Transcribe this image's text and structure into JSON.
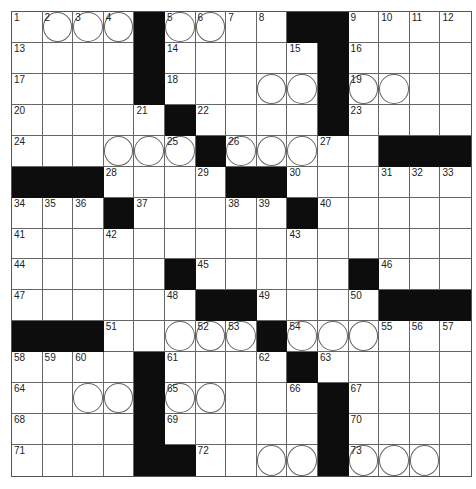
{
  "puzzle": {
    "rows": 15,
    "cols": 15,
    "colors": {
      "black_square": "#0d0d0d",
      "grid_line": "#666666",
      "background": "#ffffff"
    },
    "grid": [
      "....#....##....",
      "....#.....#....",
      "....#.....#....",
      ".....#....#....",
      "......#.....###",
      "###....##......",
      "...#.....#.....",
      "...............",
      ".....#.....#...",
      "......##....###",
      "###.....#......",
      "....#....#.....",
      "....#.....#....",
      "....#.....#....",
      "....##....#...."
    ],
    "circles": [
      [
        0,
        1
      ],
      [
        0,
        2
      ],
      [
        0,
        3
      ],
      [
        0,
        5
      ],
      [
        0,
        6
      ],
      [
        2,
        8
      ],
      [
        2,
        9
      ],
      [
        2,
        11
      ],
      [
        2,
        12
      ],
      [
        4,
        3
      ],
      [
        4,
        4
      ],
      [
        4,
        5
      ],
      [
        4,
        7
      ],
      [
        4,
        8
      ],
      [
        4,
        9
      ],
      [
        10,
        5
      ],
      [
        10,
        6
      ],
      [
        10,
        7
      ],
      [
        10,
        9
      ],
      [
        10,
        10
      ],
      [
        10,
        11
      ],
      [
        12,
        2
      ],
      [
        12,
        3
      ],
      [
        12,
        5
      ],
      [
        12,
        6
      ],
      [
        14,
        8
      ],
      [
        14,
        9
      ],
      [
        14,
        11
      ],
      [
        14,
        12
      ],
      [
        14,
        13
      ]
    ],
    "numbers": [
      {
        "r": 0,
        "c": 0,
        "n": "1"
      },
      {
        "r": 0,
        "c": 1,
        "n": "2"
      },
      {
        "r": 0,
        "c": 2,
        "n": "3"
      },
      {
        "r": 0,
        "c": 3,
        "n": "4"
      },
      {
        "r": 0,
        "c": 5,
        "n": "5"
      },
      {
        "r": 0,
        "c": 6,
        "n": "6"
      },
      {
        "r": 0,
        "c": 7,
        "n": "7"
      },
      {
        "r": 0,
        "c": 8,
        "n": "8"
      },
      {
        "r": 0,
        "c": 11,
        "n": "9"
      },
      {
        "r": 0,
        "c": 12,
        "n": "10"
      },
      {
        "r": 0,
        "c": 13,
        "n": "11"
      },
      {
        "r": 0,
        "c": 14,
        "n": "12"
      },
      {
        "r": 1,
        "c": 0,
        "n": "13"
      },
      {
        "r": 1,
        "c": 5,
        "n": "14"
      },
      {
        "r": 1,
        "c": 9,
        "n": "15"
      },
      {
        "r": 1,
        "c": 11,
        "n": "16"
      },
      {
        "r": 2,
        "c": 0,
        "n": "17"
      },
      {
        "r": 2,
        "c": 5,
        "n": "18"
      },
      {
        "r": 2,
        "c": 11,
        "n": "19"
      },
      {
        "r": 3,
        "c": 0,
        "n": "20"
      },
      {
        "r": 3,
        "c": 4,
        "n": "21"
      },
      {
        "r": 3,
        "c": 6,
        "n": "22"
      },
      {
        "r": 3,
        "c": 11,
        "n": "23"
      },
      {
        "r": 4,
        "c": 0,
        "n": "24"
      },
      {
        "r": 4,
        "c": 5,
        "n": "25"
      },
      {
        "r": 4,
        "c": 7,
        "n": "26"
      },
      {
        "r": 4,
        "c": 10,
        "n": "27"
      },
      {
        "r": 5,
        "c": 3,
        "n": "28"
      },
      {
        "r": 5,
        "c": 6,
        "n": "29"
      },
      {
        "r": 5,
        "c": 9,
        "n": "30"
      },
      {
        "r": 5,
        "c": 12,
        "n": "31"
      },
      {
        "r": 5,
        "c": 13,
        "n": "32"
      },
      {
        "r": 5,
        "c": 14,
        "n": "33"
      },
      {
        "r": 6,
        "c": 0,
        "n": "34"
      },
      {
        "r": 6,
        "c": 1,
        "n": "35"
      },
      {
        "r": 6,
        "c": 2,
        "n": "36"
      },
      {
        "r": 6,
        "c": 4,
        "n": "37"
      },
      {
        "r": 6,
        "c": 7,
        "n": "38"
      },
      {
        "r": 6,
        "c": 8,
        "n": "39"
      },
      {
        "r": 6,
        "c": 10,
        "n": "40"
      },
      {
        "r": 7,
        "c": 0,
        "n": "41"
      },
      {
        "r": 7,
        "c": 3,
        "n": "42"
      },
      {
        "r": 7,
        "c": 9,
        "n": "43"
      },
      {
        "r": 8,
        "c": 0,
        "n": "44"
      },
      {
        "r": 8,
        "c": 6,
        "n": "45"
      },
      {
        "r": 8,
        "c": 12,
        "n": "46"
      },
      {
        "r": 9,
        "c": 0,
        "n": "47"
      },
      {
        "r": 9,
        "c": 5,
        "n": "48"
      },
      {
        "r": 9,
        "c": 8,
        "n": "49"
      },
      {
        "r": 9,
        "c": 11,
        "n": "50"
      },
      {
        "r": 10,
        "c": 3,
        "n": "51"
      },
      {
        "r": 10,
        "c": 6,
        "n": "52"
      },
      {
        "r": 10,
        "c": 7,
        "n": "53"
      },
      {
        "r": 10,
        "c": 9,
        "n": "54"
      },
      {
        "r": 10,
        "c": 12,
        "n": "55"
      },
      {
        "r": 10,
        "c": 13,
        "n": "56"
      },
      {
        "r": 10,
        "c": 14,
        "n": "57"
      },
      {
        "r": 11,
        "c": 0,
        "n": "58"
      },
      {
        "r": 11,
        "c": 1,
        "n": "59"
      },
      {
        "r": 11,
        "c": 2,
        "n": "60"
      },
      {
        "r": 11,
        "c": 5,
        "n": "61"
      },
      {
        "r": 11,
        "c": 8,
        "n": "62"
      },
      {
        "r": 11,
        "c": 10,
        "n": "63"
      },
      {
        "r": 12,
        "c": 0,
        "n": "64"
      },
      {
        "r": 12,
        "c": 5,
        "n": "65"
      },
      {
        "r": 12,
        "c": 9,
        "n": "66"
      },
      {
        "r": 12,
        "c": 11,
        "n": "67"
      },
      {
        "r": 13,
        "c": 0,
        "n": "68"
      },
      {
        "r": 13,
        "c": 5,
        "n": "69"
      },
      {
        "r": 13,
        "c": 11,
        "n": "70"
      },
      {
        "r": 14,
        "c": 0,
        "n": "71"
      },
      {
        "r": 14,
        "c": 6,
        "n": "72"
      },
      {
        "r": 14,
        "c": 11,
        "n": "73"
      }
    ]
  }
}
